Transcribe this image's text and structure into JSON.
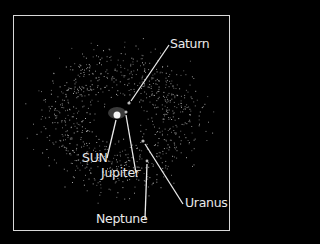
{
  "diagram": {
    "background": "#000000",
    "frame_color": "#d8d8d8",
    "label_color": "#eaeaea",
    "particle_color": "#9a9a9a",
    "bodies": [
      {
        "name": "SUN",
        "x": 117,
        "y": 115,
        "r": 3.5
      },
      {
        "name": "Jupiter",
        "x": 126,
        "y": 112,
        "r": 1.5
      },
      {
        "name": "Saturn",
        "x": 129,
        "y": 103,
        "r": 1.5
      },
      {
        "name": "Uranus",
        "x": 143,
        "y": 141,
        "r": 1.5
      },
      {
        "name": "Neptune",
        "x": 147,
        "y": 161,
        "r": 1.5
      }
    ],
    "labels": {
      "saturn": "Saturn",
      "sun": "SUN",
      "jupiter": "Jupiter",
      "uranus": "Uranus",
      "neptune": "Neptune"
    }
  }
}
